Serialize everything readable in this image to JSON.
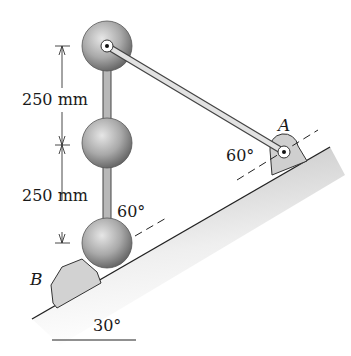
{
  "diagram": {
    "type": "statics-mechanism",
    "labels": {
      "dim_upper": "250 mm",
      "dim_lower": "250 mm",
      "angle_at_bottom_sphere": "60°",
      "angle_at_A": "60°",
      "incline_angle": "30°",
      "point_A": "A",
      "point_B": "B"
    },
    "components": {
      "spheres": 3,
      "vertical_rod": "connects three spheres",
      "link": "from top sphere pin to pin A",
      "incline": "30° slope",
      "stop_B": "block at lower end of incline",
      "support_A": "pinned bracket on incline"
    },
    "colors": {
      "sphere_light": "#d8d8d8",
      "sphere_dark": "#6e6e6e",
      "bracket": "#cfcfcf",
      "line": "#222222",
      "ground_shade": "#bdbdbd"
    }
  }
}
